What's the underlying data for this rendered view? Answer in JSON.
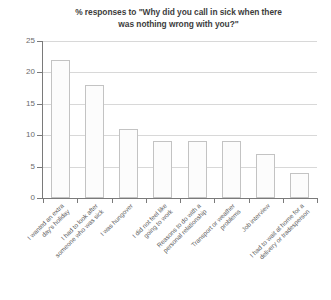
{
  "chart_data": {
    "type": "bar",
    "title": "% responses to \"Why did you call in sick when there was nothing wrong with you?\"",
    "title_line1": "% responses to \"Why did you call in sick when there",
    "title_line2": "was nothing wrong with you?\"",
    "xlabel": "",
    "ylabel": "",
    "ylim": [
      0,
      25
    ],
    "ytick_labels": [
      "0",
      "5",
      "10",
      "15",
      "20",
      "25"
    ],
    "ytick_values": [
      0,
      5,
      10,
      15,
      20,
      25
    ],
    "grid": true,
    "grid_axis": "y",
    "legend": false,
    "categories": [
      "I wanted an extra\nday's holiday",
      "I had to look after\nsomeone who was sick",
      "I was hungover",
      "I did not feel like\ngoing to work",
      "Reasons to do with a\npersonal relationship",
      "Transport or weather\nproblems",
      "Job interview",
      "I had to wait at home for a\ndelivery or tradesperson"
    ],
    "values": [
      22,
      18,
      11,
      9,
      9,
      9,
      7,
      4
    ],
    "bar_fill_color": "#fcfcfc",
    "bar_border_color": "#c3c3c3",
    "grid_color": "#d8d8d8",
    "axis_color": "#7a7a7a",
    "text_color": "#5e5e5e",
    "background_color": "#ffffff"
  }
}
